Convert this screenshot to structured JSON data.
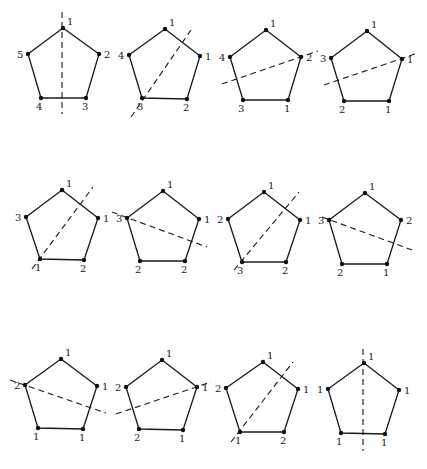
{
  "figure": {
    "colors": {
      "ink": "#1a1a1a",
      "background": "#ffffff"
    },
    "pentagons": [
      {
        "id": "p1",
        "vertices": [
          [
            63,
            28
          ],
          [
            99,
            54
          ],
          [
            86,
            98
          ],
          [
            41,
            98
          ],
          [
            28,
            54
          ]
        ],
        "labels": [
          "1",
          "2",
          "3",
          "4",
          "5"
        ],
        "axis": [
          [
            62,
            12
          ],
          [
            62,
            114
          ]
        ]
      },
      {
        "id": "p2",
        "vertices": [
          [
            165,
            29
          ],
          [
            200,
            56
          ],
          [
            187,
            99
          ],
          [
            142,
            98
          ],
          [
            129,
            55
          ]
        ],
        "labels": [
          "1",
          "1",
          "2",
          "3",
          "4"
        ],
        "axis": [
          [
            131,
            117
          ],
          [
            191,
            30
          ]
        ]
      },
      {
        "id": "p3",
        "vertices": [
          [
            266,
            30
          ],
          [
            301,
            57
          ],
          [
            288,
            100
          ],
          [
            243,
            100
          ],
          [
            230,
            57
          ]
        ],
        "labels": [
          "1",
          "2",
          "1",
          "3",
          "4"
        ],
        "axis": [
          [
            222,
            84
          ],
          [
            318,
            51
          ]
        ]
      },
      {
        "id": "p4",
        "vertices": [
          [
            367,
            31
          ],
          [
            402,
            59
          ],
          [
            389,
            101
          ],
          [
            344,
            101
          ],
          [
            331,
            58
          ]
        ],
        "labels": [
          "1",
          "1",
          "1",
          "2",
          "3"
        ],
        "axis": [
          [
            324,
            85
          ],
          [
            418,
            53
          ]
        ]
      },
      {
        "id": "p5",
        "vertices": [
          [
            62,
            190
          ],
          [
            98,
            218
          ],
          [
            84,
            260
          ],
          [
            40,
            259
          ],
          [
            26,
            217
          ]
        ],
        "labels": [
          "1",
          "1",
          "2",
          "1",
          "3"
        ],
        "axis": [
          [
            32,
            269
          ],
          [
            93,
            187
          ]
        ]
      },
      {
        "id": "p6",
        "vertices": [
          [
            163,
            191
          ],
          [
            199,
            219
          ],
          [
            185,
            261
          ],
          [
            140,
            261
          ],
          [
            127,
            218
          ]
        ],
        "labels": [
          "1",
          "1",
          "2",
          "2",
          "3"
        ],
        "axis": [
          [
            112,
            212
          ],
          [
            207,
            247
          ]
        ]
      },
      {
        "id": "p7",
        "vertices": [
          [
            264,
            192
          ],
          [
            300,
            220
          ],
          [
            286,
            262
          ],
          [
            242,
            262
          ],
          [
            228,
            219
          ]
        ],
        "labels": [
          "1",
          "1",
          "2",
          "3",
          "2"
        ],
        "axis": [
          [
            234,
            270
          ],
          [
            299,
            192
          ]
        ]
      },
      {
        "id": "p8",
        "vertices": [
          [
            365,
            193
          ],
          [
            401,
            220
          ],
          [
            387,
            264
          ],
          [
            342,
            264
          ],
          [
            329,
            220
          ]
        ],
        "labels": [
          "1",
          "2",
          "1",
          "2",
          "3"
        ],
        "axis": [
          [
            322,
            217
          ],
          [
            415,
            251
          ]
        ]
      },
      {
        "id": "p9",
        "vertices": [
          [
            61,
            359
          ],
          [
            97,
            386
          ],
          [
            83,
            429
          ],
          [
            38,
            428
          ],
          [
            25,
            385
          ]
        ],
        "labels": [
          "1",
          "1",
          "1",
          "1",
          "2"
        ],
        "axis": [
          [
            10,
            380
          ],
          [
            106,
            413
          ]
        ]
      },
      {
        "id": "p10",
        "vertices": [
          [
            162,
            360
          ],
          [
            197,
            387
          ],
          [
            183,
            430
          ],
          [
            139,
            429
          ],
          [
            126,
            387
          ]
        ],
        "labels": [
          "1",
          "1",
          "1",
          "2",
          "2"
        ],
        "axis": [
          [
            116,
            414
          ],
          [
            211,
            382
          ]
        ]
      },
      {
        "id": "p11",
        "vertices": [
          [
            263,
            362
          ],
          [
            298,
            389
          ],
          [
            284,
            432
          ],
          [
            240,
            432
          ],
          [
            226,
            388
          ]
        ],
        "labels": [
          "1",
          "1",
          "2",
          "1",
          "2"
        ],
        "axis": [
          [
            231,
            442
          ],
          [
            293,
            362
          ]
        ]
      },
      {
        "id": "p12",
        "vertices": [
          [
            364,
            363
          ],
          [
            399,
            390
          ],
          [
            385,
            434
          ],
          [
            341,
            433
          ],
          [
            328,
            389
          ]
        ],
        "labels": [
          "1",
          "1",
          "1",
          "1",
          "1"
        ],
        "axis": [
          [
            363,
            349
          ],
          [
            363,
            451
          ]
        ]
      }
    ]
  }
}
